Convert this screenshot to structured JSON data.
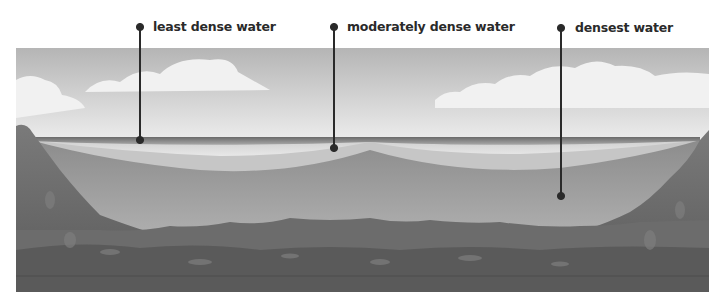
{
  "diagram": {
    "type": "lake cross-section, water density layers",
    "labels": [
      {
        "text": "least dense water",
        "dot_top": [
          140,
          27
        ],
        "dot_bottom": [
          140,
          140
        ]
      },
      {
        "text": "moderately dense water",
        "dot_top": [
          334,
          27
        ],
        "dot_bottom": [
          334,
          148
        ]
      },
      {
        "text": "densest water",
        "dot_top": [
          561,
          28
        ],
        "dot_bottom": [
          561,
          196
        ]
      }
    ],
    "colors": {
      "sky_top": "#b8b8b8",
      "sky_bottom": "#e4e4e4",
      "cloud": "#f2f2f2",
      "surface_line": "#6e6e6e",
      "least_dense": "#dcdcdc",
      "moderately_dense": "#c4c4c4",
      "densest": "#9a9a9a",
      "rock": "#6a6a6a",
      "rock_dark": "#555555",
      "pointer": "#2a2a2a"
    }
  }
}
